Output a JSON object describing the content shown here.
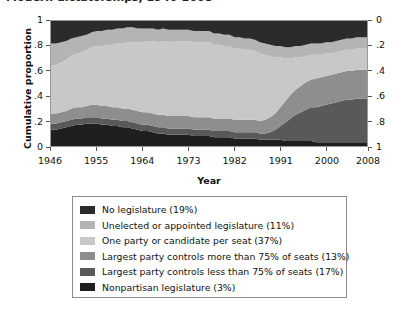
{
  "title_partial": "Modern dictatorships, 1946-2008",
  "axes": {
    "ylabel": "Cumulative proportion",
    "xlabel": "Year",
    "y_ticks_left": [
      "0",
      ".2",
      ".4",
      ".6",
      ".8",
      "1"
    ],
    "y_ticks_right": [
      "0",
      ".2",
      ".4",
      ".6",
      ".8",
      "1"
    ],
    "x_ticks": [
      "1946",
      "1955",
      "1964",
      "1973",
      "1982",
      "1991",
      "2000",
      "2008"
    ]
  },
  "legend": {
    "items": [
      {
        "label": "No legislature (19%)",
        "color": "#2b2b2b"
      },
      {
        "label": "Unelected or appointed legislature (11%)",
        "color": "#b4b4b4"
      },
      {
        "label": "One party or candidate per seat (37%)",
        "color": "#c8c8c8"
      },
      {
        "label": "Largest party controls more than 75% of seats (13%)",
        "color": "#8e8e8e"
      },
      {
        "label": "Largest party controls less than 75% of seats (17%)",
        "color": "#595959"
      },
      {
        "label": "Nonpartisan legislature (3%)",
        "color": "#1f1f1f"
      }
    ]
  },
  "chart_data": {
    "type": "area",
    "title": "Modern dictatorships, 1946-2008",
    "xlabel": "Year",
    "ylabel": "Cumulative proportion",
    "xlim": [
      1946,
      2008
    ],
    "ylim": [
      0,
      1
    ],
    "grid": false,
    "stacked": true,
    "legend_position": "below",
    "right_axis_reversed": true,
    "x": [
      1946,
      1947,
      1948,
      1949,
      1950,
      1951,
      1952,
      1953,
      1954,
      1955,
      1956,
      1957,
      1958,
      1959,
      1960,
      1961,
      1962,
      1963,
      1964,
      1965,
      1966,
      1967,
      1968,
      1969,
      1970,
      1971,
      1972,
      1973,
      1974,
      1975,
      1976,
      1977,
      1978,
      1979,
      1980,
      1981,
      1982,
      1983,
      1984,
      1985,
      1986,
      1987,
      1988,
      1989,
      1990,
      1991,
      1992,
      1993,
      1994,
      1995,
      1996,
      1997,
      1998,
      1999,
      2000,
      2001,
      2002,
      2003,
      2004,
      2005,
      2006,
      2007,
      2008
    ],
    "series": [
      {
        "name": "Nonpartisan legislature (3%)",
        "color": "#1f1f1f",
        "share_overall": 0.03,
        "values": [
          0.13,
          0.13,
          0.14,
          0.15,
          0.16,
          0.17,
          0.17,
          0.18,
          0.18,
          0.18,
          0.17,
          0.17,
          0.16,
          0.16,
          0.15,
          0.15,
          0.14,
          0.13,
          0.12,
          0.12,
          0.11,
          0.1,
          0.1,
          0.09,
          0.09,
          0.09,
          0.09,
          0.09,
          0.08,
          0.08,
          0.08,
          0.08,
          0.07,
          0.07,
          0.07,
          0.07,
          0.06,
          0.06,
          0.06,
          0.06,
          0.06,
          0.05,
          0.05,
          0.05,
          0.05,
          0.05,
          0.04,
          0.04,
          0.04,
          0.04,
          0.04,
          0.04,
          0.03,
          0.03,
          0.03,
          0.03,
          0.03,
          0.03,
          0.03,
          0.03,
          0.03,
          0.03,
          0.03
        ]
      },
      {
        "name": "Largest party controls less than 75% of seats (17%)",
        "color": "#595959",
        "share_overall": 0.17,
        "values": [
          0.05,
          0.05,
          0.05,
          0.05,
          0.05,
          0.05,
          0.05,
          0.05,
          0.05,
          0.05,
          0.05,
          0.05,
          0.05,
          0.05,
          0.05,
          0.05,
          0.05,
          0.05,
          0.05,
          0.05,
          0.05,
          0.05,
          0.05,
          0.05,
          0.05,
          0.05,
          0.05,
          0.05,
          0.05,
          0.05,
          0.05,
          0.05,
          0.05,
          0.05,
          0.05,
          0.05,
          0.05,
          0.05,
          0.05,
          0.05,
          0.05,
          0.05,
          0.05,
          0.06,
          0.08,
          0.11,
          0.15,
          0.18,
          0.21,
          0.23,
          0.25,
          0.27,
          0.28,
          0.29,
          0.3,
          0.31,
          0.32,
          0.33,
          0.34,
          0.34,
          0.35,
          0.35,
          0.35
        ]
      },
      {
        "name": "Largest party controls more than 75% of seats (13%)",
        "color": "#8e8e8e",
        "share_overall": 0.13,
        "values": [
          0.08,
          0.08,
          0.08,
          0.08,
          0.09,
          0.09,
          0.09,
          0.09,
          0.1,
          0.1,
          0.1,
          0.1,
          0.1,
          0.1,
          0.1,
          0.1,
          0.1,
          0.1,
          0.1,
          0.1,
          0.1,
          0.1,
          0.1,
          0.1,
          0.1,
          0.1,
          0.1,
          0.1,
          0.1,
          0.1,
          0.1,
          0.1,
          0.1,
          0.1,
          0.1,
          0.1,
          0.1,
          0.1,
          0.1,
          0.1,
          0.1,
          0.1,
          0.11,
          0.12,
          0.13,
          0.15,
          0.17,
          0.19,
          0.2,
          0.21,
          0.22,
          0.22,
          0.23,
          0.23,
          0.23,
          0.23,
          0.23,
          0.23,
          0.23,
          0.23,
          0.23,
          0.23,
          0.23
        ]
      },
      {
        "name": "One party or candidate per seat (37%)",
        "color": "#c8c8c8",
        "share_overall": 0.37,
        "values": [
          0.38,
          0.39,
          0.4,
          0.41,
          0.42,
          0.43,
          0.44,
          0.45,
          0.46,
          0.47,
          0.48,
          0.49,
          0.5,
          0.51,
          0.52,
          0.53,
          0.54,
          0.55,
          0.56,
          0.57,
          0.58,
          0.58,
          0.59,
          0.59,
          0.6,
          0.6,
          0.6,
          0.6,
          0.6,
          0.6,
          0.6,
          0.6,
          0.59,
          0.59,
          0.58,
          0.58,
          0.57,
          0.57,
          0.56,
          0.56,
          0.55,
          0.54,
          0.52,
          0.49,
          0.45,
          0.4,
          0.34,
          0.29,
          0.26,
          0.23,
          0.21,
          0.2,
          0.19,
          0.18,
          0.18,
          0.17,
          0.17,
          0.17,
          0.17,
          0.17,
          0.17,
          0.17,
          0.17
        ]
      },
      {
        "name": "Unelected or appointed legislature (11%)",
        "color": "#b4b4b4",
        "share_overall": 0.11,
        "values": [
          0.18,
          0.17,
          0.16,
          0.15,
          0.14,
          0.13,
          0.13,
          0.12,
          0.12,
          0.12,
          0.12,
          0.12,
          0.12,
          0.12,
          0.12,
          0.12,
          0.12,
          0.11,
          0.11,
          0.1,
          0.1,
          0.1,
          0.1,
          0.1,
          0.09,
          0.09,
          0.09,
          0.09,
          0.09,
          0.09,
          0.09,
          0.09,
          0.09,
          0.09,
          0.09,
          0.09,
          0.09,
          0.09,
          0.09,
          0.09,
          0.09,
          0.09,
          0.09,
          0.09,
          0.09,
          0.09,
          0.09,
          0.09,
          0.09,
          0.09,
          0.09,
          0.09,
          0.09,
          0.09,
          0.09,
          0.09,
          0.09,
          0.09,
          0.09,
          0.09,
          0.09,
          0.09,
          0.09
        ]
      },
      {
        "name": "No legislature (19%)",
        "color": "#2b2b2b",
        "share_overall": 0.19,
        "values": [
          0.18,
          0.18,
          0.17,
          0.16,
          0.14,
          0.13,
          0.12,
          0.11,
          0.09,
          0.08,
          0.08,
          0.07,
          0.07,
          0.06,
          0.06,
          0.05,
          0.05,
          0.06,
          0.06,
          0.06,
          0.06,
          0.07,
          0.06,
          0.07,
          0.07,
          0.07,
          0.07,
          0.07,
          0.08,
          0.08,
          0.08,
          0.08,
          0.1,
          0.1,
          0.11,
          0.11,
          0.13,
          0.13,
          0.14,
          0.14,
          0.15,
          0.17,
          0.18,
          0.19,
          0.2,
          0.2,
          0.21,
          0.21,
          0.2,
          0.2,
          0.19,
          0.18,
          0.18,
          0.18,
          0.17,
          0.17,
          0.16,
          0.15,
          0.14,
          0.14,
          0.13,
          0.13,
          0.13
        ]
      }
    ]
  }
}
